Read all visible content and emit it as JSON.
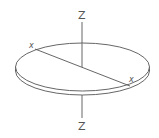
{
  "diagram": {
    "labels": {
      "z_top": "Z",
      "z_bottom": "Z",
      "x_left": "x",
      "x_right": "x"
    },
    "colors": {
      "stroke": "#555555",
      "fill": "#ffffff"
    }
  }
}
